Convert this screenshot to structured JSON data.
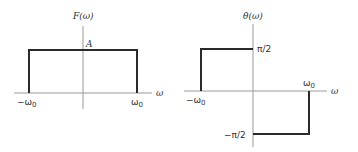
{
  "left_plot": {
    "y_label": "F(ω)",
    "x_label": "ω",
    "level_label": "A",
    "neg_tick": "−ω",
    "neg_tick_sub": "0",
    "pos_tick": "ω",
    "pos_tick_sub": "0"
  },
  "right_plot": {
    "y_label": "θ(ω)",
    "x_label": "ω",
    "pos_level": "π/2",
    "neg_level": "−π/2",
    "neg_tick": "−ω",
    "neg_tick_sub": "0",
    "pos_tick": "ω",
    "pos_tick_sub": "0"
  },
  "colors": {
    "axis": "#9a9a9a",
    "curve": "#2a2a2a",
    "text": "#333333"
  }
}
